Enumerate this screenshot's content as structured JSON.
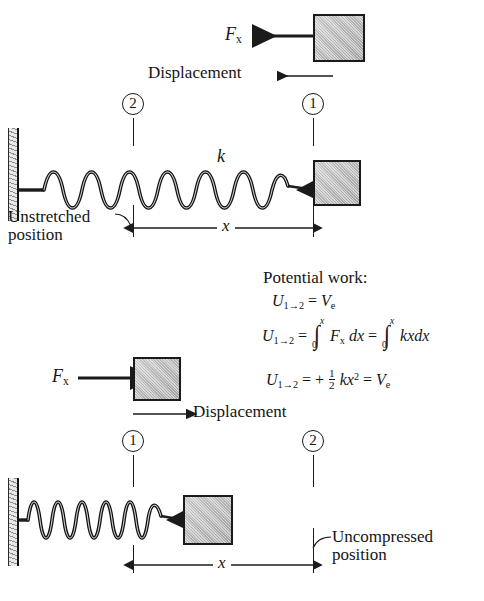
{
  "figure": {
    "upper": {
      "force_label": "F",
      "force_sub": "x",
      "displacement_label": "Displacement",
      "spring_constant_label": "k",
      "marker_left": "2",
      "marker_right": "1",
      "unstretched_label": "Unstretched position",
      "unstretched_line1": "Unstretched",
      "unstretched_line2": "position",
      "dimension_label": "x"
    },
    "lower": {
      "force_label": "F",
      "force_sub": "x",
      "displacement_label": "Displacement",
      "marker_left": "1",
      "marker_right": "2",
      "uncompressed_line1": "Uncompressed",
      "uncompressed_line2": "position",
      "dimension_label": "x"
    }
  },
  "equations": {
    "heading": "Potential work:",
    "line1": {
      "lhs_u": "U",
      "lhs_sub": "1→2",
      "eq": "=",
      "rhs_v": "V",
      "rhs_sub": "e"
    },
    "line2": {
      "lhs_u": "U",
      "lhs_sub": "1→2",
      "eq1": "=",
      "int1_upper": "x",
      "int1_lower": "0",
      "integrand1_f": "F",
      "integrand1_sub": "x",
      "integrand1_dx": "dx",
      "eq2": "=",
      "int2_upper": "x",
      "int2_lower": "0",
      "integrand2": "kxdx"
    },
    "line3": {
      "lhs_u": "U",
      "lhs_sub": "1→2",
      "eq1": "= +",
      "frac_num": "1",
      "frac_den": "2",
      "k": "k",
      "x": "x",
      "power": "2",
      "eq2": "=",
      "rhs_v": "V",
      "rhs_sub": "e"
    }
  },
  "colors": {
    "ink": "#151515",
    "line": "#1b1b1b",
    "block_fill": "#bdbdbd",
    "wall_hatch": "#8e8e8e",
    "background": "#ffffff"
  }
}
